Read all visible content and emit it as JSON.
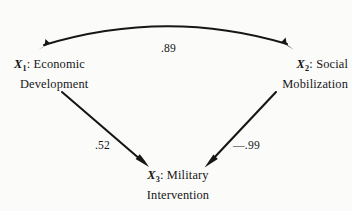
{
  "diagram": {
    "type": "path-analysis-diagram",
    "background_color": "#fbfbfa",
    "ink_color": "#161616",
    "nodes": [
      {
        "id": "x1",
        "variable": "X",
        "subscript": "1",
        "separator": ":",
        "line1": "Economic",
        "line2": "Development"
      },
      {
        "id": "x2",
        "variable": "X",
        "subscript": "2",
        "separator": ":",
        "line1": "Social",
        "line2": "Mobilization"
      },
      {
        "id": "x3",
        "variable": "X",
        "subscript": "3",
        "separator": ":",
        "line1": "Military",
        "line2": "Intervention"
      }
    ],
    "paths": [
      {
        "id": "correlation-x1-x2",
        "from": "x1",
        "to": "x2",
        "style": "curved-double-headed",
        "coefficient": ".89"
      },
      {
        "id": "path-x1-x3",
        "from": "x1",
        "to": "x3",
        "style": "straight-single-headed",
        "coefficient": ".52"
      },
      {
        "id": "path-x2-x3",
        "from": "x2",
        "to": "x3",
        "style": "straight-single-headed",
        "coefficient": "—.99"
      }
    ]
  }
}
